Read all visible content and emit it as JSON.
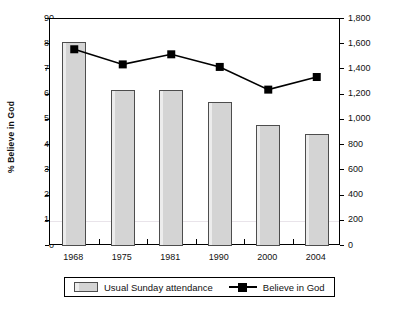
{
  "chart_data": {
    "type": "bar",
    "title": "",
    "subtitle": "",
    "xlabel": "",
    "categories": [
      "1968",
      "1975",
      "1981",
      "1990",
      "2000",
      "2004"
    ],
    "grid": true,
    "legend_position": "bottom",
    "axes": {
      "left": {
        "label": "% Believe in God",
        "min": 0,
        "max": 90,
        "step": 10,
        "ticks": [
          "0",
          "10",
          "20",
          "30",
          "40",
          "50",
          "60",
          "70",
          "80",
          "90"
        ]
      },
      "right": {
        "label": "Usual Sunday attendance (thousands)",
        "min": 0,
        "max": 1800,
        "step": 200,
        "ticks": [
          "0",
          "200",
          "400",
          "600",
          "800",
          "1,000",
          "1,200",
          "1,400",
          "1,600",
          "1,800"
        ]
      }
    },
    "series": [
      {
        "name": "Usual Sunday attendance",
        "type": "bar",
        "axis": "right",
        "unit": "thousands",
        "color": "#d4d4d4",
        "edge_color": "#4d4d4d",
        "values": [
          1620,
          1240,
          1240,
          1140,
          960,
          890
        ]
      },
      {
        "name": "Believe in God",
        "type": "line",
        "axis": "left",
        "unit": "%",
        "color": "#000000",
        "marker": "square",
        "values": [
          78,
          72,
          76,
          71,
          62,
          67
        ]
      }
    ]
  },
  "legend": {
    "entries": [
      {
        "label": "Usual Sunday attendance",
        "swatch": "bar-swatch"
      },
      {
        "label": "Believe in God",
        "swatch": "line-marker-swatch"
      }
    ]
  }
}
